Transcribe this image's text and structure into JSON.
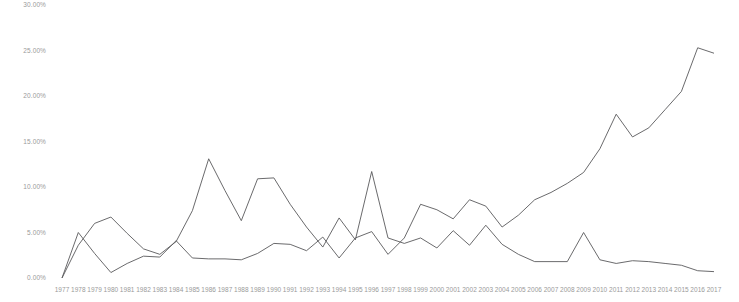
{
  "chart_data": {
    "type": "line",
    "title": "",
    "subtitle": "",
    "xlabel": "",
    "ylabel": "",
    "grid": false,
    "legend_position": "none",
    "xlim": [
      1977,
      2017
    ],
    "ylim": [
      0,
      30
    ],
    "y_tick_labels": [
      "0.00%",
      "5.00%",
      "10.00%",
      "15.00%",
      "20.00%",
      "25.00%",
      "30.00%"
    ],
    "y_tick_values": [
      0,
      5,
      10,
      15,
      20,
      25,
      30
    ],
    "x": [
      1977,
      1978,
      1979,
      1980,
      1981,
      1982,
      1983,
      1984,
      1985,
      1986,
      1987,
      1988,
      1989,
      1990,
      1991,
      1992,
      1993,
      1994,
      1995,
      1996,
      1997,
      1998,
      1999,
      2000,
      2001,
      2002,
      2003,
      2004,
      2005,
      2006,
      2007,
      2008,
      2009,
      2010,
      2011,
      2012,
      2013,
      2014,
      2015,
      2016,
      2017
    ],
    "categories": [
      "1977",
      "1978",
      "1979",
      "1980",
      "1981",
      "1982",
      "1983",
      "1984",
      "1985",
      "1986",
      "1987",
      "1988",
      "1989",
      "1990",
      "1991",
      "1992",
      "1993",
      "1994",
      "1995",
      "1996",
      "1997",
      "1998",
      "1999",
      "2000",
      "2001",
      "2002",
      "2003",
      "2004",
      "2005",
      "2006",
      "2007",
      "2008",
      "2009",
      "2010",
      "2011",
      "2012",
      "2013",
      "2014",
      "2015",
      "2016",
      "2017"
    ],
    "series": [
      {
        "name": "series-1",
        "color": "#59595b",
        "values": [
          0.0,
          5.0,
          2.7,
          0.6,
          1.6,
          2.4,
          2.3,
          4.1,
          2.2,
          2.1,
          2.1,
          2.0,
          2.7,
          3.8,
          3.7,
          3.0,
          4.5,
          2.2,
          4.4,
          5.1,
          2.6,
          4.4,
          8.1,
          7.5,
          6.5,
          8.6,
          7.9,
          5.6,
          6.9,
          8.6,
          9.4,
          10.4,
          11.6,
          14.2,
          18.0,
          15.5,
          16.5,
          18.5,
          20.5,
          25.3,
          24.7
        ]
      },
      {
        "name": "series-2",
        "color": "#59595b",
        "values": [
          0.0,
          3.6,
          6.0,
          6.7,
          4.9,
          3.2,
          2.6,
          4.0,
          7.4,
          13.1,
          9.6,
          6.3,
          10.9,
          11.0,
          8.1,
          5.6,
          3.4,
          6.6,
          4.2,
          11.7,
          4.4,
          3.8,
          4.4,
          3.3,
          5.2,
          3.6,
          5.8,
          3.7,
          2.6,
          1.8,
          1.8,
          1.8,
          5.0,
          2.0,
          1.6,
          1.9,
          1.8,
          1.6,
          1.4,
          0.8,
          0.7
        ]
      }
    ]
  }
}
